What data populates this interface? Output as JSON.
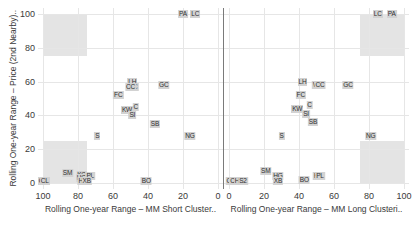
{
  "chart_data": {
    "type": "scatter",
    "title": "",
    "ylabel": "Rolling One-year Range – Price (2nd Nearby)..",
    "ylim": [
      0,
      100
    ],
    "yticks": [
      0,
      20,
      40,
      60,
      80,
      100
    ],
    "grid": true,
    "legend": "none",
    "panels": [
      {
        "name": "mm-short-cluster",
        "xlabel": "Rolling One-year Range – MM Short Cluster..",
        "xlim": [
          100,
          0
        ],
        "reversed": true,
        "xticks": [
          100,
          80,
          60,
          40,
          20,
          0
        ],
        "shaded_regions": [
          {
            "name": "upper-left-quadrant",
            "x0": 100,
            "x1": 75,
            "y0": 75,
            "y1": 100
          },
          {
            "name": "lower-left-quadrant",
            "x0": 100,
            "x1": 75,
            "y0": 0,
            "y1": 25
          }
        ],
        "points": [
          {
            "label": "PA",
            "x": 20,
            "y": 100
          },
          {
            "label": "LC",
            "x": 13,
            "y": 100
          },
          {
            "label": "LH",
            "x": 49,
            "y": 60
          },
          {
            "label": "WC",
            "x": 49,
            "y": 57
          },
          {
            "label": "CC",
            "x": 50,
            "y": 57
          },
          {
            "label": "GC",
            "x": 31,
            "y": 58
          },
          {
            "label": "FC",
            "x": 57,
            "y": 52
          },
          {
            "label": "C",
            "x": 47,
            "y": 45
          },
          {
            "label": "KW",
            "x": 52,
            "y": 43
          },
          {
            "label": "SI",
            "x": 49,
            "y": 40
          },
          {
            "label": "SB",
            "x": 36,
            "y": 35
          },
          {
            "label": "S",
            "x": 69,
            "y": 28
          },
          {
            "label": "NG",
            "x": 16,
            "y": 28
          },
          {
            "label": "SM",
            "x": 86,
            "y": 6
          },
          {
            "label": "KC",
            "x": 78,
            "y": 5
          },
          {
            "label": "HG",
            "x": 78,
            "y": 3
          },
          {
            "label": "PL",
            "x": 73,
            "y": 4
          },
          {
            "label": "HO",
            "x": 77,
            "y": 1
          },
          {
            "label": "XB",
            "x": 75,
            "y": 1
          },
          {
            "label": "CB",
            "x": 100,
            "y": 1
          },
          {
            "label": "CL",
            "x": 99,
            "y": 1
          },
          {
            "label": "BO",
            "x": 41,
            "y": 1
          }
        ]
      },
      {
        "name": "mm-long-cluster",
        "xlabel": "Rolling One-year Range – MM Long Clusteri..",
        "xlim": [
          0,
          100
        ],
        "reversed": false,
        "xticks": [
          0,
          20,
          40,
          60,
          80,
          100
        ],
        "shaded_regions": [
          {
            "name": "upper-right-quadrant",
            "x0": 75,
            "x1": 100,
            "y0": 75,
            "y1": 100
          },
          {
            "name": "lower-right-quadrant",
            "x0": 75,
            "x1": 100,
            "y0": 0,
            "y1": 25
          }
        ],
        "points": [
          {
            "label": "LC",
            "x": 85,
            "y": 100
          },
          {
            "label": "PA",
            "x": 93,
            "y": 100
          },
          {
            "label": "LH",
            "x": 42,
            "y": 60
          },
          {
            "label": "WC",
            "x": 51,
            "y": 58
          },
          {
            "label": "CC",
            "x": 52,
            "y": 58
          },
          {
            "label": "GC",
            "x": 68,
            "y": 58
          },
          {
            "label": "FC",
            "x": 41,
            "y": 52
          },
          {
            "label": "C",
            "x": 46,
            "y": 46
          },
          {
            "label": "KW",
            "x": 39,
            "y": 44
          },
          {
            "label": "SI",
            "x": 44,
            "y": 41
          },
          {
            "label": "SB",
            "x": 48,
            "y": 36
          },
          {
            "label": "S",
            "x": 30,
            "y": 28
          },
          {
            "label": "NG",
            "x": 81,
            "y": 28
          },
          {
            "label": "SM",
            "x": 21,
            "y": 7
          },
          {
            "label": "HG",
            "x": 28,
            "y": 4
          },
          {
            "label": "XB",
            "x": 28,
            "y": 1
          },
          {
            "label": "BO",
            "x": 43,
            "y": 2
          },
          {
            "label": "KC",
            "x": 51,
            "y": 4
          },
          {
            "label": "PL",
            "x": 52,
            "y": 4
          },
          {
            "label": "CB",
            "x": 1,
            "y": 1
          },
          {
            "label": "CL",
            "x": 3,
            "y": 1
          },
          {
            "label": "HO",
            "x": 6,
            "y": 1
          },
          {
            "label": "S2",
            "x": 8,
            "y": 1
          }
        ]
      }
    ]
  },
  "colors": {
    "point_fill": "#d2d2d2",
    "quadrant_fill": "#d9d9d9",
    "grid": "#e6e6e6",
    "axis": "#7a7a7a",
    "text": "#3a3a3a"
  }
}
